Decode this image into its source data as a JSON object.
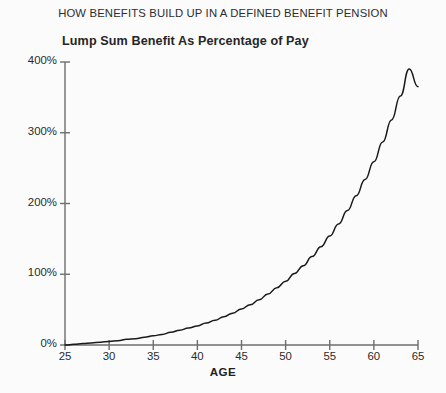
{
  "chart_data": {
    "type": "line",
    "title": "HOW BENEFITS BUILD UP IN A DEFINED BENEFIT PENSION",
    "subtitle": "Lump Sum Benefit As Percentage of Pay",
    "xlabel": "AGE",
    "ylabel": "",
    "xlim": [
      25,
      65
    ],
    "ylim": [
      0,
      400
    ],
    "grid": false,
    "legend": "none",
    "line_color": "#1a1a1a",
    "background_color": "#fbfbfb",
    "axis_color": "#6e6e6e",
    "x_tick_labels": [
      "25",
      "30",
      "35",
      "40",
      "45",
      "50",
      "55",
      "60",
      "65"
    ],
    "x_ticks": [
      25,
      30,
      35,
      40,
      45,
      50,
      55,
      60,
      65
    ],
    "y_tick_labels": [
      "0%",
      "100%",
      "200%",
      "300%",
      "400%"
    ],
    "y_ticks": [
      0,
      100,
      200,
      300,
      400
    ],
    "series": [
      {
        "name": "Lump Sum Benefit As Percentage of Pay",
        "x": [
          25,
          26,
          27,
          28,
          29,
          30,
          31,
          32,
          33,
          34,
          35,
          36,
          37,
          38,
          39,
          40,
          41,
          42,
          43,
          44,
          45,
          46,
          47,
          48,
          49,
          50,
          51,
          52,
          53,
          54,
          55,
          56,
          57,
          58,
          59,
          60,
          61,
          62,
          63,
          64,
          65
        ],
        "values": [
          0,
          1,
          2,
          3,
          4,
          5,
          6,
          8,
          9,
          11,
          13,
          15,
          18,
          21,
          24,
          27,
          31,
          35,
          40,
          45,
          51,
          57,
          64,
          72,
          81,
          90,
          101,
          112,
          125,
          139,
          154,
          171,
          190,
          211,
          234,
          259,
          287,
          318,
          352,
          390,
          365
        ]
      }
    ]
  }
}
